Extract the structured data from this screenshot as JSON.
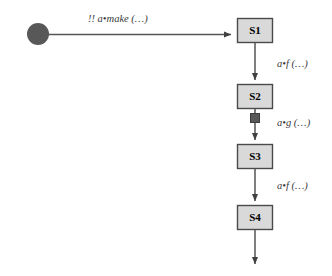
{
  "diagram": {
    "type": "state-transition-sequence",
    "background": "#ffffff",
    "colors": {
      "state_fill": "#d9d9d9",
      "state_border": "#4a4a4a",
      "initial_marker": "#585858",
      "arrow": "#555555",
      "label_text": "#3a3a3a",
      "state_text": "#000000",
      "square_marker": "#585858"
    },
    "initial_marker": {
      "name": "initial-state-dot",
      "shape": "filled-circle",
      "cx": 38,
      "cy": 34,
      "r": 11
    },
    "states": [
      {
        "id": "s1",
        "label": "S1",
        "x": 237,
        "y": 18,
        "w": 36,
        "h": 25
      },
      {
        "id": "s2",
        "label": "S2",
        "x": 237,
        "y": 84,
        "w": 36,
        "h": 25
      },
      {
        "id": "s3",
        "label": "S3",
        "x": 237,
        "y": 144,
        "w": 36,
        "h": 25
      },
      {
        "id": "s4",
        "label": "S4",
        "x": 237,
        "y": 205,
        "w": 36,
        "h": 25
      }
    ],
    "transitions": [
      {
        "id": "t0",
        "from": "start",
        "to": "s1",
        "orientation": "horizontal",
        "label_prefix": "!!",
        "label_receiver": "a",
        "label_separator": "•",
        "label_method": "make",
        "label_args": "(…)",
        "label_full": "!! a•make (…)",
        "label_x": 88,
        "label_y": 22,
        "marker": "none"
      },
      {
        "id": "t1",
        "from": "s1",
        "to": "s2",
        "orientation": "vertical",
        "label_prefix": "",
        "label_receiver": "a",
        "label_separator": "•",
        "label_method": "f",
        "label_args": "(…)",
        "label_full": "a•f (…)",
        "label_x": 277,
        "label_y": 67,
        "marker": "none"
      },
      {
        "id": "t2",
        "from": "s2",
        "to": "s3",
        "orientation": "vertical",
        "label_prefix": "",
        "label_receiver": "a",
        "label_separator": "•",
        "label_method": "g",
        "label_args": "(…)",
        "label_full": "a•g (…)",
        "label_x": 277,
        "label_y": 126,
        "marker": "filled-square"
      },
      {
        "id": "t3",
        "from": "s3",
        "to": "s4",
        "orientation": "vertical",
        "label_prefix": "",
        "label_receiver": "a",
        "label_separator": "•",
        "label_method": "f",
        "label_args": "(…)",
        "label_full": "a•f (…)",
        "label_x": 277,
        "label_y": 189,
        "marker": "none"
      },
      {
        "id": "t4",
        "from": "s4",
        "to": "continuation",
        "orientation": "vertical",
        "label_full": "",
        "marker": "none"
      }
    ],
    "square_marker": {
      "name": "activation-square-marker",
      "x": 250,
      "y": 114,
      "size": 9
    }
  }
}
